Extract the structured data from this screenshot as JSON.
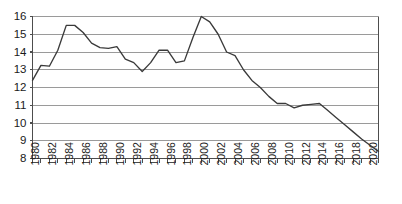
{
  "chart_data": {
    "type": "line",
    "title": "",
    "subtitle": "",
    "xlabel": "",
    "ylabel": "",
    "xlim": [
      1980,
      2021
    ],
    "ylim": [
      8,
      16
    ],
    "grid": true,
    "grid_axis": "y",
    "legend": "none",
    "line_color": "#3a3a3a",
    "grid_color": "#9a9a9a",
    "axis_color": "#4d4d4d",
    "background": "#ffffff",
    "y_ticks": [
      8,
      9,
      10,
      11,
      12,
      13,
      14,
      15,
      16
    ],
    "y_tick_labels": [
      "8",
      "9",
      "10",
      "11",
      "12",
      "13",
      "14",
      "15",
      "16"
    ],
    "x_ticks": [
      1980,
      1981,
      1982,
      1983,
      1984,
      1985,
      1986,
      1987,
      1988,
      1989,
      1990,
      1991,
      1992,
      1993,
      1994,
      1995,
      1996,
      1997,
      1998,
      1999,
      2000,
      2001,
      2002,
      2003,
      2004,
      2005,
      2006,
      2007,
      2008,
      2009,
      2010,
      2011,
      2012,
      2013,
      2014,
      2015,
      2016,
      2017,
      2018,
      2019,
      2020,
      2021
    ],
    "x_tick_labels": [
      "1980",
      "1982",
      "1984",
      "1986",
      "1988",
      "1990",
      "1992",
      "1994",
      "1996",
      "1998",
      "2000",
      "2002",
      "2004",
      "2006",
      "2008",
      "2010",
      "2012",
      "2014",
      "2016",
      "2018",
      "2020"
    ],
    "x_tick_label_years": [
      1980,
      1982,
      1984,
      1986,
      1988,
      1990,
      1992,
      1994,
      1996,
      1998,
      2000,
      2002,
      2004,
      2006,
      2008,
      2010,
      2012,
      2014,
      2016,
      2018,
      2020
    ],
    "x_tick_label_rotation": -90,
    "x": [
      1980,
      1981,
      1982,
      1983,
      1984,
      1985,
      1986,
      1987,
      1988,
      1989,
      1990,
      1991,
      1992,
      1993,
      1994,
      1995,
      1996,
      1997,
      1998,
      1999,
      2000,
      2001,
      2002,
      2003,
      2004,
      2005,
      2006,
      2007,
      2008,
      2009,
      2010,
      2011,
      2012,
      2013,
      2014,
      2015,
      2016,
      2017,
      2018,
      2019,
      2020,
      2021
    ],
    "values": [
      12.4,
      13.25,
      13.2,
      14.1,
      15.5,
      15.5,
      15.1,
      14.5,
      14.25,
      14.2,
      14.3,
      13.6,
      13.4,
      12.9,
      13.4,
      14.1,
      14.1,
      13.4,
      13.5,
      14.8,
      16.0,
      15.7,
      15.0,
      14.0,
      13.8,
      13.0,
      12.4,
      12.0,
      11.5,
      11.1,
      11.1,
      10.85,
      11.0,
      11.05,
      11.1,
      10.7,
      10.3,
      9.9,
      9.5,
      9.1,
      8.75,
      8.4
    ],
    "series": [
      {
        "name": "series-1",
        "values": [
          12.4,
          13.25,
          13.2,
          14.1,
          15.5,
          15.5,
          15.1,
          14.5,
          14.25,
          14.2,
          14.3,
          13.6,
          13.4,
          12.9,
          13.4,
          14.1,
          14.1,
          13.4,
          13.5,
          14.8,
          16.0,
          15.7,
          15.0,
          14.0,
          13.8,
          13.0,
          12.4,
          12.0,
          11.5,
          11.1,
          11.1,
          10.85,
          11.0,
          11.05,
          11.1,
          10.7,
          10.3,
          9.9,
          9.5,
          9.1,
          8.75,
          8.4
        ]
      }
    ]
  }
}
